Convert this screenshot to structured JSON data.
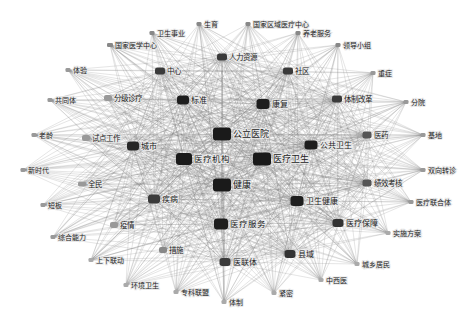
{
  "diagram": {
    "type": "co-occurrence-network",
    "nodes": [
      {
        "id": "gongli_yiyuan",
        "label": "公立医院",
        "x": 222,
        "y": 134,
        "w": 18,
        "h": 13,
        "size": "xl",
        "color": "#1a1a1a"
      },
      {
        "id": "yiliao_jigou",
        "label": "医疗机构",
        "x": 184,
        "y": 159,
        "w": 16,
        "h": 12,
        "size": "l",
        "color": "#1a1a1a"
      },
      {
        "id": "yiliao_weisheng",
        "label": "医疗卫生",
        "x": 262,
        "y": 159,
        "w": 18,
        "h": 13,
        "size": "xl",
        "color": "#1a1a1a"
      },
      {
        "id": "jiankang",
        "label": "健康",
        "x": 222,
        "y": 185,
        "w": 18,
        "h": 13,
        "size": "xl",
        "color": "#1a1a1a"
      },
      {
        "id": "yiliao_fuwu",
        "label": "医疗服务",
        "x": 221,
        "y": 224,
        "w": 14,
        "h": 11,
        "size": "l",
        "color": "#1e1e1e"
      },
      {
        "id": "biaozhun",
        "label": "标准",
        "x": 183,
        "y": 100,
        "w": 12,
        "h": 9,
        "size": "m",
        "color": "#1e1e1e"
      },
      {
        "id": "kangfu",
        "label": "康复",
        "x": 263,
        "y": 104,
        "w": 13,
        "h": 10,
        "size": "m",
        "color": "#1e1e1e"
      },
      {
        "id": "chengshi",
        "label": "城市",
        "x": 133,
        "y": 146,
        "w": 12,
        "h": 9,
        "size": "m",
        "color": "#262626"
      },
      {
        "id": "gonggong_weisheng",
        "label": "公共卫生",
        "x": 311,
        "y": 145,
        "w": 13,
        "h": 9,
        "size": "m",
        "color": "#1e1e1e"
      },
      {
        "id": "weisheng_jiankang",
        "label": "卫生健康",
        "x": 297,
        "y": 201,
        "w": 13,
        "h": 10,
        "size": "m",
        "color": "#1e1e1e"
      },
      {
        "id": "jibing",
        "label": "疾病",
        "x": 154,
        "y": 199,
        "w": 12,
        "h": 9,
        "size": "m",
        "color": "#3a3a3a"
      },
      {
        "id": "yiliao_baozhang",
        "label": "医疗保障",
        "x": 338,
        "y": 223,
        "w": 11,
        "h": 8,
        "size": "m",
        "color": "#333333"
      },
      {
        "id": "xianyu",
        "label": "县域",
        "x": 290,
        "y": 254,
        "w": 11,
        "h": 8,
        "size": "m",
        "color": "#333333"
      },
      {
        "id": "yilianti",
        "label": "医联体",
        "x": 225,
        "y": 262,
        "w": 11,
        "h": 8,
        "size": "m",
        "color": "#3a3a3a"
      },
      {
        "id": "zhongxin",
        "label": "中心",
        "x": 160,
        "y": 71,
        "w": 10,
        "h": 7,
        "size": "s",
        "color": "#3a3a3a"
      },
      {
        "id": "renli_ziyuan",
        "label": "人力资源",
        "x": 222,
        "y": 57,
        "w": 10,
        "h": 7,
        "size": "s",
        "color": "#3a3a3a"
      },
      {
        "id": "shequ",
        "label": "社区",
        "x": 288,
        "y": 71,
        "w": 10,
        "h": 7,
        "size": "s",
        "color": "#3a3a3a"
      },
      {
        "id": "tizhi_gaige",
        "label": "体制改革",
        "x": 337,
        "y": 99,
        "w": 10,
        "h": 7,
        "size": "s",
        "color": "#3a3a3a"
      },
      {
        "id": "yiyao",
        "label": "医药",
        "x": 367,
        "y": 135,
        "w": 9,
        "h": 7,
        "size": "s",
        "color": "#555555"
      },
      {
        "id": "jixiao_kaohe",
        "label": "绩效考核",
        "x": 367,
        "y": 183,
        "w": 9,
        "h": 7,
        "size": "s",
        "color": "#555555"
      },
      {
        "id": "cuoshi",
        "label": "措施",
        "x": 163,
        "y": 250,
        "w": 8,
        "h": 6,
        "size": "s",
        "color": "#888888"
      },
      {
        "id": "yiqing",
        "label": "疫情",
        "x": 114,
        "y": 225,
        "w": 8,
        "h": 6,
        "size": "s",
        "color": "#999999"
      },
      {
        "id": "quanmin",
        "label": "全民",
        "x": 82,
        "y": 184,
        "w": 8,
        "h": 5,
        "size": "s",
        "color": "#999999"
      },
      {
        "id": "shidian_gongzuo",
        "label": "试点工作",
        "x": 86,
        "y": 138,
        "w": 8,
        "h": 6,
        "size": "s",
        "color": "#999999"
      },
      {
        "id": "fenji_zhenliao",
        "label": "分级诊疗",
        "x": 108,
        "y": 98,
        "w": 8,
        "h": 6,
        "size": "s",
        "color": "#999999"
      },
      {
        "id": "guojia_yixue_zhongxin",
        "label": "国家医学中心",
        "x": 110,
        "y": 45,
        "w": 6,
        "h": 4,
        "size": "xs",
        "color": "#888888"
      },
      {
        "id": "weisheng_shiye",
        "label": "卫生事业",
        "x": 152,
        "y": 33,
        "w": 5,
        "h": 4,
        "size": "xs",
        "color": "#888888"
      },
      {
        "id": "shengyu",
        "label": "生育",
        "x": 199,
        "y": 24,
        "w": 5,
        "h": 4,
        "size": "xs",
        "color": "#888888"
      },
      {
        "id": "guojia_quyu",
        "label": "国家区域医疗中心",
        "x": 248,
        "y": 24,
        "w": 5,
        "h": 4,
        "size": "xs",
        "color": "#888888"
      },
      {
        "id": "yanglao_fuwu",
        "label": "养老服务",
        "x": 298,
        "y": 33,
        "w": 5,
        "h": 4,
        "size": "xs",
        "color": "#888888"
      },
      {
        "id": "lingdao_xiaozu",
        "label": "领导小组",
        "x": 338,
        "y": 45,
        "w": 5,
        "h": 4,
        "size": "xs",
        "color": "#888888"
      },
      {
        "id": "zhongzheng",
        "label": "重症",
        "x": 373,
        "y": 73,
        "w": 5,
        "h": 4,
        "size": "xs",
        "color": "#999999"
      },
      {
        "id": "fenyuan",
        "label": "分院",
        "x": 406,
        "y": 102,
        "w": 5,
        "h": 4,
        "size": "xs",
        "color": "#999999"
      },
      {
        "id": "jidi",
        "label": "基地",
        "x": 423,
        "y": 135,
        "w": 5,
        "h": 4,
        "size": "xs",
        "color": "#999999"
      },
      {
        "id": "shuangxiang_zhuanzhen",
        "label": "双向转诊",
        "x": 423,
        "y": 170,
        "w": 5,
        "h": 4,
        "size": "xs",
        "color": "#999999"
      },
      {
        "id": "yiliao_lianheti",
        "label": "医疗联合体",
        "x": 411,
        "y": 202,
        "w": 5,
        "h": 4,
        "size": "xs",
        "color": "#999999"
      },
      {
        "id": "shishi_fangan",
        "label": "实施方案",
        "x": 388,
        "y": 233,
        "w": 5,
        "h": 4,
        "size": "xs",
        "color": "#aaaaaa"
      },
      {
        "id": "chengxiang_jumin",
        "label": "城乡居民",
        "x": 357,
        "y": 264,
        "w": 5,
        "h": 4,
        "size": "xs",
        "color": "#aaaaaa"
      },
      {
        "id": "zhongxiyi",
        "label": "中西医",
        "x": 321,
        "y": 280,
        "w": 5,
        "h": 4,
        "size": "xs",
        "color": "#aaaaaa"
      },
      {
        "id": "jinmi",
        "label": "紧密",
        "x": 274,
        "y": 293,
        "w": 5,
        "h": 4,
        "size": "xs",
        "color": "#aaaaaa"
      },
      {
        "id": "tizhi",
        "label": "体制",
        "x": 224,
        "y": 302,
        "w": 5,
        "h": 4,
        "size": "xs",
        "color": "#aaaaaa"
      },
      {
        "id": "zhuanke_lianmeng",
        "label": "专科联盟",
        "x": 176,
        "y": 292,
        "w": 5,
        "h": 4,
        "size": "xs",
        "color": "#aaaaaa"
      },
      {
        "id": "huanjing_weisheng",
        "label": "环境卫生",
        "x": 126,
        "y": 285,
        "w": 5,
        "h": 4,
        "size": "xs",
        "color": "#aaaaaa"
      },
      {
        "id": "shangxia_liandong",
        "label": "上下联动",
        "x": 91,
        "y": 260,
        "w": 5,
        "h": 4,
        "size": "xs",
        "color": "#aaaaaa"
      },
      {
        "id": "zonghe_nengli",
        "label": "综合能力",
        "x": 53,
        "y": 237,
        "w": 5,
        "h": 4,
        "size": "xs",
        "color": "#999999"
      },
      {
        "id": "duanban",
        "label": "短板",
        "x": 43,
        "y": 205,
        "w": 5,
        "h": 4,
        "size": "xs",
        "color": "#999999"
      },
      {
        "id": "xinshidai",
        "label": "新时代",
        "x": 23,
        "y": 170,
        "w": 5,
        "h": 4,
        "size": "xs",
        "color": "#999999"
      },
      {
        "id": "laoling",
        "label": "老龄",
        "x": 34,
        "y": 135,
        "w": 5,
        "h": 4,
        "size": "xs",
        "color": "#999999"
      },
      {
        "id": "gongtongti",
        "label": "共同体",
        "x": 50,
        "y": 100,
        "w": 5,
        "h": 4,
        "size": "xs",
        "color": "#999999"
      },
      {
        "id": "tiyan",
        "label": "体验",
        "x": 68,
        "y": 70,
        "w": 5,
        "h": 4,
        "size": "xs",
        "color": "#999999"
      }
    ],
    "hubs": [
      "gongli_yiyuan",
      "yiliao_jigou",
      "yiliao_weisheng",
      "jiankang",
      "yiliao_fuwu",
      "biaozhun",
      "kangfu",
      "chengshi",
      "gonggong_weisheng",
      "weisheng_jiankang",
      "jibing",
      "yiliao_baozhang",
      "xianyu",
      "yilianti",
      "zhongxin",
      "renli_ziyuan",
      "shequ",
      "tizhi_gaige",
      "yiyao",
      "jixiao_kaohe"
    ]
  }
}
